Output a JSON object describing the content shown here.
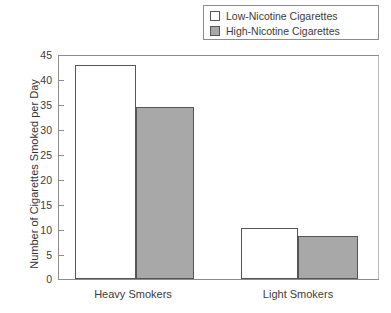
{
  "chart_data": {
    "type": "bar",
    "title": "",
    "xlabel": "",
    "ylabel": "Number of Cigarettes Smoked per Day",
    "categories": [
      "Heavy Smokers",
      "Light Smokers"
    ],
    "series": [
      {
        "name": "Low-Nicotine Cigarettes",
        "color": "#ffffff",
        "values": [
          43,
          10.3
        ]
      },
      {
        "name": "High-Nicotine Cigarettes",
        "color": "#a8a8a8",
        "values": [
          34.5,
          8.6
        ]
      }
    ],
    "ylim": [
      0,
      45
    ],
    "ytick_step": 5,
    "yticks": [
      45,
      40,
      35,
      30,
      25,
      20,
      15,
      10,
      5,
      0
    ],
    "ytick_labels": [
      "45",
      "40",
      "35",
      "30",
      "25",
      "20",
      "15",
      "10",
      "5",
      "0"
    ],
    "grid": false,
    "legend_position": "top-right",
    "legend": [
      {
        "label": "Low-Nicotine Cigarettes",
        "swatch": "#ffffff"
      },
      {
        "label": "High-Nicotine Cigarettes",
        "swatch": "#a8a8a8"
      }
    ],
    "axis_color": "#8d8d8d",
    "bar_outline_color": "#555555"
  }
}
